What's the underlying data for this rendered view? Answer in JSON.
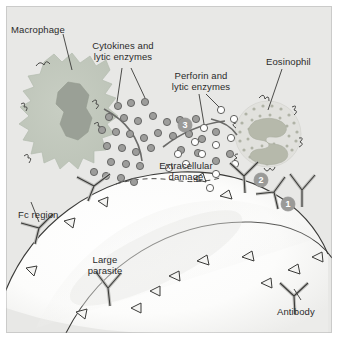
{
  "figure": {
    "background_color": "#e8e8e6",
    "border_color": "#ffffff"
  },
  "labels": {
    "macrophage": "Macrophage",
    "cytokines": "Cytokines and\nlytic enzymes",
    "cytokines_line1": "Cytokines and",
    "cytokines_line2": "lytic enzymes",
    "perforin_line1": "Perforin and",
    "perforin_line2": "lytic enzymes",
    "eosinophil": "Eosinophil",
    "extracellular_line1": "Extracellular",
    "extracellular_line2": "damage",
    "fc_region": "Fc region",
    "large_parasite_line1": "Large",
    "large_parasite_line2": "parasite",
    "antibody": "Antibody"
  },
  "steps": [
    {
      "id": "1",
      "label": "1",
      "meaning": "antibody binds parasite surface antigen"
    },
    {
      "id": "2",
      "label": "2",
      "meaning": "effector cell Fc receptor binds antibody Fc region"
    },
    {
      "id": "3",
      "label": "3",
      "meaning": "granule release causes extracellular damage"
    }
  ],
  "colors": {
    "panel_bg": "#e8e8e6",
    "macrophage_body": "#c2c9bd",
    "macrophage_nucleus": "#9aa096",
    "eosinophil_nucleus": "#b9bcae",
    "eosinophil_granule": "#b8bbb0",
    "cytokine_dot_fill": "#9d9d9b",
    "cytokine_dot_stroke": "#6b6b69",
    "perforin_dot_fill": "#ffffff",
    "perforin_dot_stroke": "#6b6b69",
    "parasite_fill": "#fdfdfc",
    "antibody_fill": "#bdbdba",
    "antibody_stroke": "#3a3a38",
    "outline": "#4a4a48",
    "step_circle": "#9a9a98",
    "text": "#2b2b2b"
  },
  "cell_types": {
    "macrophage": {
      "name": "macrophage-cell",
      "shape": "amoeboid with pseudopodia",
      "nucleus": "large irregular dark"
    },
    "eosinophil_top": {
      "name": "eosinophil-cell-upper",
      "nucleus": "bilobed C-shape",
      "granules": "dense cytoplasmic dots"
    },
    "eosinophil_bottom": {
      "name": "eosinophil-cell-lower",
      "nucleus": "bilobed C-shape",
      "granules": "dense cytoplasmic dots"
    }
  },
  "mediators": {
    "cytokine_dots": {
      "style": "filled gray circles",
      "count_approx": 30
    },
    "perforin_dots": {
      "style": "open white circles",
      "count_approx": 13
    }
  },
  "antibodies": {
    "style": "Y-shaped, Fc stem anchored to parasite surface",
    "count_full_y": 6,
    "count_triangle_profile": 14
  }
}
